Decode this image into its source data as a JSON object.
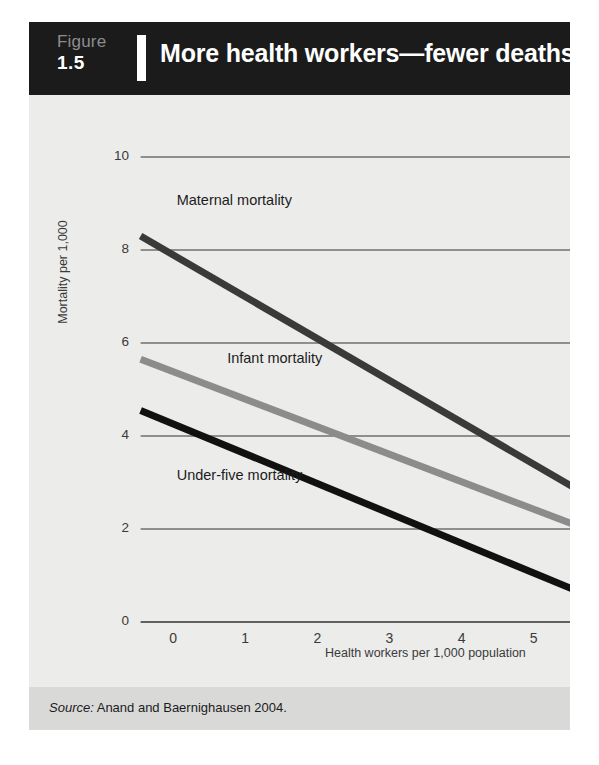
{
  "header": {
    "figure_word": "Figure",
    "figure_number": "1.5",
    "title": "More health workers—fewer deaths"
  },
  "footer": {
    "source_prefix": "Source:",
    "source_text": " Anand and Baernighausen 2004."
  },
  "colors": {
    "header_background": "#1b1b1b",
    "card_background": "#ececeb",
    "source_band": "#d9d9d8",
    "gridline": "#333333",
    "maternal": "#3a3a3a",
    "infant": "#8c8c8c",
    "under_five": "#111111",
    "text": "#1c1c1c"
  },
  "chart_data": {
    "type": "line",
    "title": "More health workers—fewer deaths",
    "subtitle": "",
    "xlabel": "Health workers per 1,000 population",
    "ylabel": "Mortality per 1,000",
    "xlim": [
      -0.5,
      5.6
    ],
    "ylim": [
      0,
      10
    ],
    "xticks": [
      "0",
      "1",
      "2",
      "3",
      "4",
      "5"
    ],
    "xtick_values": [
      0,
      1,
      2,
      3,
      4,
      5
    ],
    "yticks": [
      "0",
      "2",
      "4",
      "6",
      "8",
      "10"
    ],
    "ytick_values": [
      0,
      2,
      4,
      6,
      8,
      10
    ],
    "grid": "horizontal",
    "legend": "inline-labels",
    "series": [
      {
        "name": "Maternal mortality",
        "color": "#3a3a3a",
        "x": [
          -0.45,
          5.55
        ],
        "values": [
          8.3,
          2.9
        ],
        "label_x": 0.05,
        "label_y": 9.05
      },
      {
        "name": "Infant mortality",
        "color": "#8c8c8c",
        "x": [
          -0.45,
          5.55
        ],
        "values": [
          5.65,
          2.1
        ],
        "label_x": 0.75,
        "label_y": 5.65
      },
      {
        "name": "Under-five mortality",
        "color": "#111111",
        "x": [
          -0.45,
          5.55
        ],
        "values": [
          4.55,
          0.7
        ],
        "label_x": 0.05,
        "label_y": 3.15
      }
    ]
  }
}
